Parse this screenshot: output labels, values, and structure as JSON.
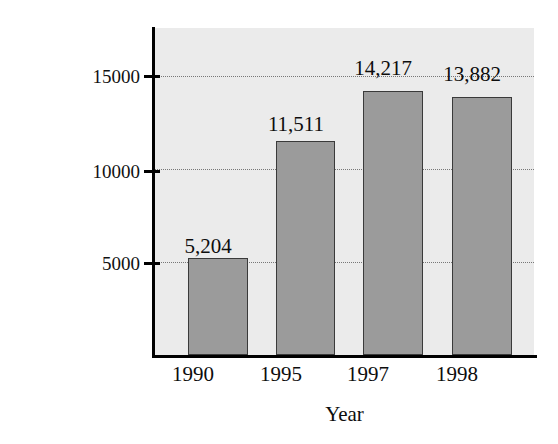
{
  "chart_data": {
    "type": "bar",
    "title": "",
    "xlabel": "Year",
    "ylabel": "Number of Instant Lottery Tickets Sold (in millions)",
    "ylabel_lines": [
      "Number of Instant Lottery",
      "Tickets Sold (in millions)"
    ],
    "categories": [
      "1990",
      "1995",
      "1997",
      "1998"
    ],
    "values": [
      5204,
      11511,
      14217,
      13882
    ],
    "value_labels": [
      "5,204",
      "11,511",
      "14,217",
      "13,882"
    ],
    "ylim": [
      0,
      17600
    ],
    "yticks": [
      5000,
      10000,
      15000
    ],
    "ytick_labels": [
      "5000",
      "10000",
      "15000"
    ],
    "grid": true,
    "grid_style": "dotted",
    "legend": null,
    "bar_color": "#9b9b9b",
    "bar_edge_color": "#3a3a3a",
    "plot_background": "#ebebeb",
    "figure_background": "#ffffff",
    "axis_color": "#000000",
    "gridline_color": "#777777"
  }
}
